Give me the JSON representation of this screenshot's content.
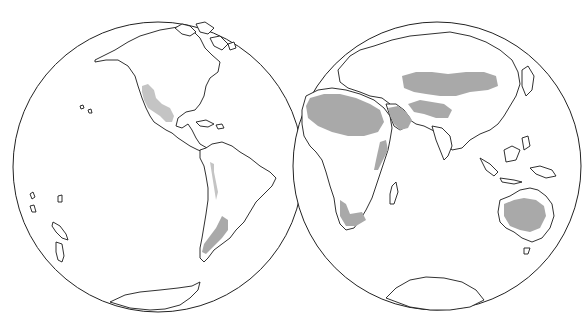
{
  "map": {
    "type": "twin-hemisphere world map",
    "hemispheres": [
      {
        "name": "western-hemisphere",
        "center": [
          158,
          167
        ],
        "radius": 145
      },
      {
        "name": "eastern-hemisphere",
        "center": [
          437,
          166
        ],
        "radius": 144
      }
    ],
    "colors": {
      "background": "#ffffff",
      "outline": "#1a1a1a",
      "shaded_region": "#a9a9a9"
    },
    "shaded_regions": [
      "western-north-america",
      "patagonia-andes",
      "sahara",
      "arabian-peninsula",
      "central-asia",
      "horn-of-africa",
      "southwest-africa",
      "australia-interior"
    ]
  }
}
